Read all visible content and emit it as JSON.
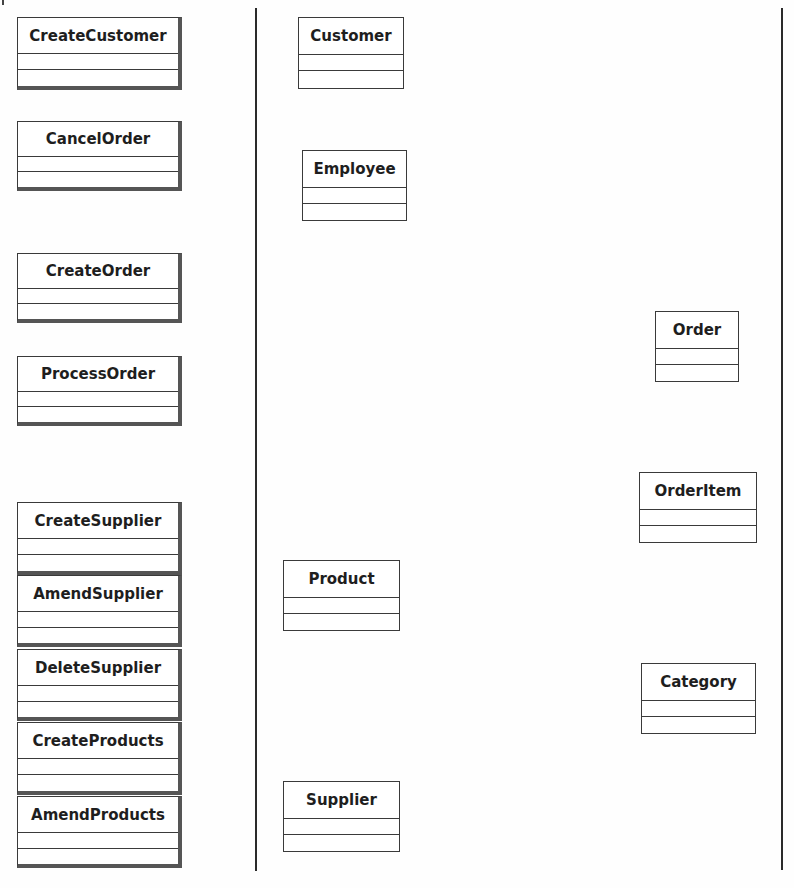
{
  "diagram": {
    "type": "uml-class-analysis",
    "columns": {
      "boundary_controls": [
        {
          "name": "CreateCustomer",
          "x": 17,
          "y": 17,
          "w": 165,
          "h": 73
        },
        {
          "name": "CancelOrder",
          "x": 17,
          "y": 121,
          "w": 165,
          "h": 70
        },
        {
          "name": "CreateOrder",
          "x": 17,
          "y": 253,
          "w": 165,
          "h": 70
        },
        {
          "name": "ProcessOrder",
          "x": 17,
          "y": 356,
          "w": 165,
          "h": 70
        },
        {
          "name": "CreateSupplier",
          "x": 17,
          "y": 502,
          "w": 165,
          "h": 73
        },
        {
          "name": "AmendSupplier",
          "x": 17,
          "y": 575,
          "w": 165,
          "h": 72
        },
        {
          "name": "DeleteSupplier",
          "x": 17,
          "y": 649,
          "w": 165,
          "h": 72
        },
        {
          "name": "CreateProducts",
          "x": 17,
          "y": 722,
          "w": 165,
          "h": 73
        },
        {
          "name": "AmendProducts",
          "x": 17,
          "y": 796,
          "w": 165,
          "h": 72
        }
      ],
      "entities_middle": [
        {
          "name": "Customer",
          "x": 298,
          "y": 17,
          "w": 106,
          "h": 72
        },
        {
          "name": "Employee",
          "x": 302,
          "y": 150,
          "w": 105,
          "h": 71
        },
        {
          "name": "Product",
          "x": 283,
          "y": 560,
          "w": 117,
          "h": 71
        },
        {
          "name": "Supplier",
          "x": 283,
          "y": 781,
          "w": 117,
          "h": 71
        }
      ],
      "entities_right": [
        {
          "name": "Order",
          "x": 655,
          "y": 311,
          "w": 84,
          "h": 71
        },
        {
          "name": "OrderItem",
          "x": 639,
          "y": 472,
          "w": 118,
          "h": 71
        },
        {
          "name": "Category",
          "x": 641,
          "y": 663,
          "w": 115,
          "h": 71
        }
      ]
    },
    "dividers": [
      {
        "name": "left-divider",
        "x": 255,
        "y": 8,
        "h": 863
      },
      {
        "name": "right-divider",
        "x": 781,
        "y": 8,
        "h": 862
      }
    ],
    "colors": {
      "line": "#2a2a2a",
      "box_border": "#3a3a3a",
      "shadow": "#555555",
      "text": "#1e1e1e",
      "background": "#fefefe"
    }
  }
}
